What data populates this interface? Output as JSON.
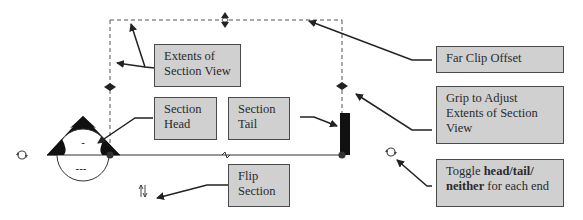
{
  "diagram": {
    "type": "section-view-annotation",
    "callouts": {
      "extents": {
        "line1": "Extents of",
        "line2": "Section View"
      },
      "far_clip": {
        "text": "Far Clip Offset"
      },
      "grip": {
        "line1": "Grip to Adjust",
        "line2": "Extents of Section",
        "line3": "View"
      },
      "head": {
        "line1": "Section",
        "line2": "Head"
      },
      "tail": {
        "line1": "Section",
        "line2": "Tail"
      },
      "flip": {
        "line1": "Flip",
        "line2": "Section"
      },
      "toggle": {
        "prefix": "Toggle ",
        "bold1": "head/tail/",
        "bold2": "neither",
        "suffix": " for each end"
      }
    },
    "symbols": {
      "head_marker_top": "-",
      "head_marker_bottom": "---"
    },
    "icons": [
      "rotate-icon",
      "flip-arrows-icon",
      "grip-arrow-icon",
      "break-line-icon"
    ],
    "colors": {
      "callout_fill": "#d0d0d0",
      "callout_border": "#4a4a4a",
      "line": "#333333"
    }
  }
}
